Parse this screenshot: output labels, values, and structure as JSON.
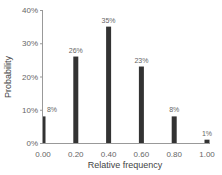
{
  "chart_data": {
    "type": "bar",
    "title": "",
    "xlabel": "Relative frequency",
    "ylabel": "Probability",
    "categories": [
      "0.00",
      "0.20",
      "0.40",
      "0.60",
      "0.80",
      "1.00"
    ],
    "x": [
      0.0,
      0.2,
      0.4,
      0.6,
      0.8,
      1.0
    ],
    "values": [
      8,
      26,
      35,
      23,
      8,
      1
    ],
    "value_labels": [
      "8%",
      "26%",
      "35%",
      "23%",
      "8%",
      "1%"
    ],
    "yticks": [
      "0%",
      "10%",
      "20%",
      "30%",
      "40%"
    ],
    "ytick_values": [
      0,
      10,
      20,
      30,
      40
    ],
    "ylim": [
      0,
      40
    ],
    "xlim": [
      0,
      1
    ],
    "grid": false,
    "legend": null,
    "bar_color": "#333333"
  }
}
